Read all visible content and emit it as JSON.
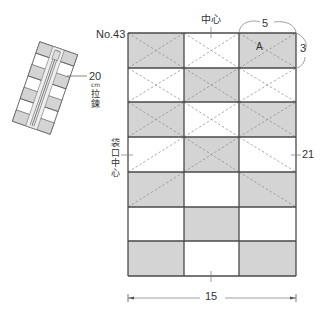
{
  "pattern": {
    "number_label": "No.43",
    "top_center_label": "中心",
    "piece_label": "A",
    "piece_width": "5",
    "piece_height": "3",
    "total_height": "21",
    "total_width": "15",
    "opening_center_label": "袋口中心",
    "zipper": {
      "length": "20",
      "unit": "cm",
      "name": "拉鍊"
    },
    "colors": {
      "shaded": "#d4d4d4",
      "plain": "#ffffff",
      "outline": "#4a4a4a",
      "dashed": "#8a8a8a"
    },
    "grid": {
      "columns": 3,
      "rows": 7,
      "shading": [
        [
          1,
          0,
          1
        ],
        [
          0,
          1,
          0
        ],
        [
          1,
          0,
          1
        ],
        [
          0,
          1,
          0
        ],
        [
          1,
          0,
          1
        ],
        [
          0,
          1,
          0
        ],
        [
          1,
          0,
          1
        ]
      ]
    }
  }
}
